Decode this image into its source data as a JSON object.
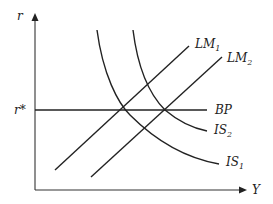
{
  "diagram": {
    "axes": {
      "y_label": "r",
      "x_label": "Y"
    },
    "reference_levels": {
      "r_star_label": "r*"
    },
    "curves": {
      "bp": {
        "main": "BP",
        "sub": ""
      },
      "lm1": {
        "main": "LM",
        "sub": "1"
      },
      "lm2": {
        "main": "LM",
        "sub": "2"
      },
      "is1": {
        "main": "IS",
        "sub": "1"
      },
      "is2": {
        "main": "IS",
        "sub": "2"
      }
    },
    "colors": {
      "line": "#222222",
      "background": "#ffffff"
    }
  }
}
